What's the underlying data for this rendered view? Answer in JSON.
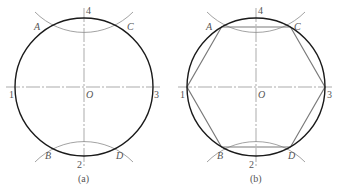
{
  "colors": {
    "circle": "#1a1a1a",
    "arc": "#8a8a8a",
    "axis": "#888888",
    "hexagon": "#7a7a7a",
    "label": "#555555"
  },
  "figures": [
    {
      "id": "a",
      "caption": "(a)",
      "center": [
        84,
        87
      ],
      "radius": 69,
      "points": {
        "A": "A",
        "B": "B",
        "C": "C",
        "D": "D",
        "O": "O",
        "p1": "1",
        "p2": "2",
        "p3": "3",
        "p4": "4"
      },
      "hexagon": false
    },
    {
      "id": "b",
      "caption": "(b)",
      "center": [
        256,
        87
      ],
      "radius": 69,
      "points": {
        "A": "A",
        "B": "B",
        "C": "C",
        "D": "D",
        "O": "O",
        "p1": "1",
        "p2": "2",
        "p3": "3",
        "p4": "4"
      },
      "hexagon": true
    }
  ]
}
